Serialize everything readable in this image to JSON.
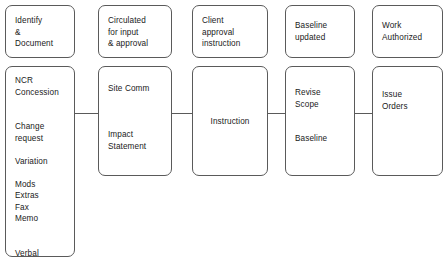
{
  "diagram": {
    "background_color": "#ffffff",
    "line_color": "#5a5a5a",
    "text_color": "#1a1a1a",
    "nodes": [
      {
        "id": "identify-document",
        "text": "Identify\n&\nDocument",
        "x": 5,
        "y": 5,
        "w": 70,
        "h": 53,
        "text_top": 9
      },
      {
        "id": "circulated-for-input-approval",
        "text": "Circulated\nfor   input\n&   approval",
        "x": 98,
        "y": 5,
        "w": 74,
        "h": 53,
        "text_top": 9
      },
      {
        "id": "client-approval-instruction",
        "text": "Client\napproval\ninstruction",
        "x": 192,
        "y": 5,
        "w": 76,
        "h": 53,
        "text_top": 9
      },
      {
        "id": "baseline-updated",
        "text": "Baseline\nupdated",
        "x": 285,
        "y": 5,
        "w": 70,
        "h": 53,
        "text_top": 14
      },
      {
        "id": "work-authorized",
        "text": "Work\nAuthorized",
        "x": 372,
        "y": 5,
        "w": 71,
        "h": 53,
        "text_top": 14
      },
      {
        "id": "ncr-concession-list",
        "text": "NCR\nConcession\n\n\nChange\nrequest\n\nVariation\n\nMods\nExtras\nFax\nMemo\n\n\nVerbal",
        "x": 5,
        "y": 66,
        "w": 70,
        "h": 191,
        "text_top": 8
      },
      {
        "id": "site-comm-impact-statement",
        "text": "Site  Comm\n\n\n\nImpact\nStatement",
        "x": 98,
        "y": 66,
        "w": 74,
        "h": 110,
        "text_top": 16
      },
      {
        "id": "instruction",
        "text": "Instruction",
        "x": 192,
        "y": 66,
        "w": 76,
        "h": 110,
        "text_top": 49
      },
      {
        "id": "revise-scope-baseline",
        "text": "Revise\nScope\n\n\nBaseline",
        "x": 285,
        "y": 66,
        "w": 70,
        "h": 110,
        "text_top": 20
      },
      {
        "id": "issue-orders",
        "text": "Issue\nOrders",
        "x": 372,
        "y": 66,
        "w": 71,
        "h": 110,
        "text_top": 22
      }
    ],
    "connectors": [
      {
        "id": "connector-ncr-to-site-comm",
        "x": 74,
        "y": 113,
        "w": 25
      },
      {
        "id": "connector-site-comm-to-instruction",
        "x": 171,
        "y": 113,
        "w": 22
      },
      {
        "id": "connector-instruction-to-revise-scope",
        "x": 267,
        "y": 113,
        "w": 19
      },
      {
        "id": "connector-revise-scope-to-issue-orders",
        "x": 354,
        "y": 113,
        "w": 19
      }
    ]
  }
}
